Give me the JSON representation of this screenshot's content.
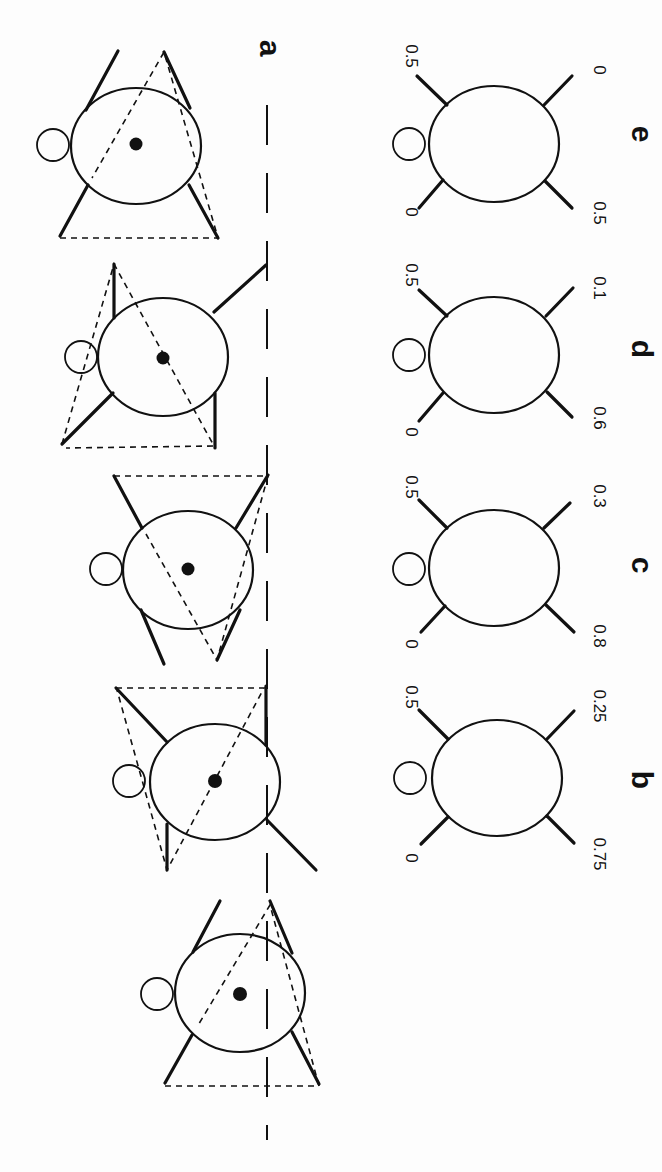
{
  "figure": {
    "orientation": "rotated 90° clockwise (figure printed sideways)",
    "panels": [
      {
        "id": "a",
        "label": "a",
        "description": "Five successive postures with supporting leg triangles (dashed) and center of mass dot along a dashed ground line"
      },
      {
        "id": "b",
        "label": "b",
        "legs": {
          "front_left": "0",
          "front_right": "0.5",
          "hind_left": "0.75",
          "hind_right": "0.25"
        }
      },
      {
        "id": "c",
        "label": "c",
        "legs": {
          "front_left": "0",
          "front_right": "0.5",
          "hind_left": "0.8",
          "hind_right": "0.3"
        }
      },
      {
        "id": "d",
        "label": "d",
        "legs": {
          "front_left": "0",
          "front_right": "0.5",
          "hind_left": "0.6",
          "hind_right": "0.1"
        }
      },
      {
        "id": "e",
        "label": "e",
        "legs": {
          "front_left": "0",
          "front_right": "0.5",
          "hind_left": "0.5",
          "hind_right": "0"
        }
      }
    ]
  },
  "labels": {
    "a": "a",
    "b": "b",
    "c": "c",
    "d": "d",
    "e": "e"
  },
  "values": {
    "b": {
      "tl": "0",
      "tr": "0.5",
      "bl": "0.75",
      "br": "0.25"
    },
    "c": {
      "tl": "0",
      "tr": "0.5",
      "bl": "0.8",
      "br": "0.3"
    },
    "d": {
      "tl": "0",
      "tr": "0.5",
      "bl": "0.6",
      "br": "0.1"
    },
    "e": {
      "tl": "0",
      "tr": "0.5",
      "bl": "0.5",
      "br": "0"
    }
  },
  "colors": {
    "ink": "#111111",
    "paper": "#fdfdfd"
  }
}
